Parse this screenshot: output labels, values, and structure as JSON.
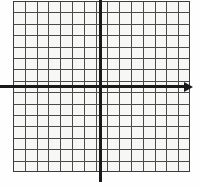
{
  "figure": {
    "kind": "coordinate-grid",
    "width": 201,
    "height": 188,
    "background_color": "#fefefe"
  },
  "chart_data": {
    "type": "scatter",
    "title": "",
    "subtitle": "",
    "xlabel": "",
    "ylabel": "",
    "annotations": [],
    "legend": [],
    "legend_position": "none",
    "grid": true,
    "series": [
      {
        "name": "",
        "x": [],
        "y": []
      }
    ],
    "xlim": [
      -8,
      8
    ],
    "ylim": [
      -8,
      8
    ],
    "xticks": [],
    "yticks": [],
    "xticklabels": [],
    "yticklabels": [],
    "grid_columns": 15,
    "grid_rows": 15,
    "origin_column_index": 7,
    "origin_row_index": 7,
    "axis_color": "#1a1a1a",
    "grid_color": "#4a4a4a",
    "cell_fill_color": "#f7f7f5"
  },
  "grid": {
    "left": 13,
    "top": 1,
    "right": 190,
    "bottom": 172,
    "columns": 15,
    "rows": 15,
    "cell_width": 11.8,
    "cell_height": 11.4,
    "line_color": "#4a4a4a",
    "fill_color": "#f7f7f5",
    "border_color": "#3c3c3c"
  },
  "axes": {
    "x_axis": {
      "name": "horizontal-axis",
      "y_position": 85,
      "start_x": 0,
      "end_x": 184,
      "thickness": 3,
      "color": "#1a1a1a",
      "has_arrow_right": true,
      "has_arrow_left": false,
      "label": ""
    },
    "y_axis": {
      "name": "vertical-axis",
      "x_position": 99,
      "start_y": 0,
      "end_y": 182,
      "thickness": 3,
      "color": "#1a1a1a",
      "has_arrow_top": false,
      "has_arrow_bottom": false,
      "label": ""
    },
    "origin": {
      "x": 100,
      "y": 86,
      "label": ""
    }
  }
}
